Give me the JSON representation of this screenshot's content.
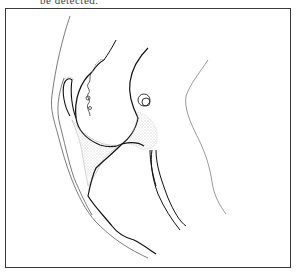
{
  "page": {
    "caption_fragment": "be detected."
  },
  "figure": {
    "frame_color": "#3a3a3a",
    "line_color": "#111111",
    "stipple_color": "#9a9a9a"
  }
}
